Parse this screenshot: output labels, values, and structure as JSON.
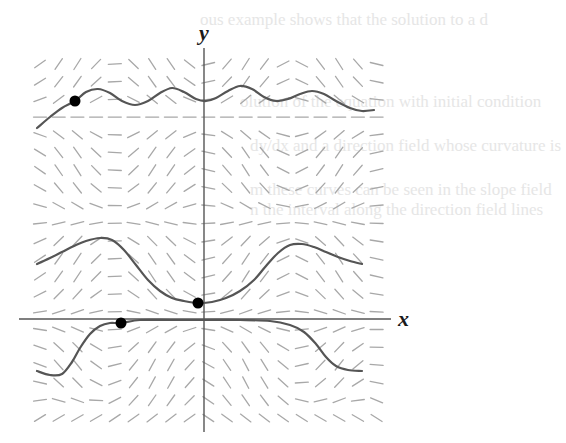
{
  "figure": {
    "type": "direction-field",
    "x_axis_label": "x",
    "y_axis_label": "y",
    "colors": {
      "background": "#ffffff",
      "axis": "#555555",
      "slope_segment": "#a8a8a8",
      "solution_curve": "#555555",
      "initial_point": "#000000",
      "bleed_text": "#e6e6e6"
    },
    "bleed_through_text": [
      {
        "text": "ous example shows that the solution to a d",
        "x": 200,
        "y": 10
      },
      {
        "text": "olution of the equation with initial condition",
        "x": 240,
        "y": 92
      },
      {
        "text": "dy/dx and a direction field whose curvature is",
        "x": 250,
        "y": 136
      },
      {
        "text": "m these curves can be seen in the slope field",
        "x": 250,
        "y": 180
      },
      {
        "text": "n the interval along the direction field lines",
        "x": 250,
        "y": 200
      }
    ],
    "axes": {
      "origin_px": [
        204,
        319
      ],
      "x_axis_px": {
        "x_start": 19,
        "x_end": 391,
        "y": 319
      },
      "y_axis_px": {
        "x": 204,
        "y_start": 48,
        "y_end": 432
      },
      "x_label_px": [
        398,
        306
      ],
      "y_label_px": [
        199,
        20
      ]
    },
    "slope_field": {
      "grid_x_start": 40,
      "grid_x_end": 378,
      "grid_x_step": 18.7,
      "grid_y_start": 64,
      "grid_y_end": 418,
      "grid_y_step": 17.7,
      "segment_length": 13
    },
    "solution_curves": [
      {
        "name": "upper-curve",
        "points": [
          [
            37,
            128
          ],
          [
            50,
            117
          ],
          [
            62,
            108
          ],
          [
            75,
            101
          ],
          [
            86,
            92
          ],
          [
            98,
            89
          ],
          [
            110,
            93
          ],
          [
            122,
            101
          ],
          [
            135,
            105
          ],
          [
            148,
            101
          ],
          [
            160,
            93
          ],
          [
            172,
            88
          ],
          [
            184,
            92
          ],
          [
            196,
            99
          ],
          [
            206,
            101
          ],
          [
            216,
            98
          ],
          [
            228,
            91
          ],
          [
            240,
            86
          ],
          [
            252,
            89
          ],
          [
            264,
            97
          ],
          [
            276,
            101
          ],
          [
            288,
            99
          ],
          [
            300,
            94
          ],
          [
            312,
            91
          ],
          [
            324,
            94
          ],
          [
            336,
            101
          ],
          [
            350,
            108
          ],
          [
            362,
            111
          ],
          [
            374,
            110
          ]
        ]
      },
      {
        "name": "middle-curve",
        "points": [
          [
            37,
            264
          ],
          [
            50,
            258
          ],
          [
            62,
            252
          ],
          [
            74,
            246
          ],
          [
            86,
            241
          ],
          [
            100,
            238
          ],
          [
            112,
            240
          ],
          [
            124,
            250
          ],
          [
            136,
            265
          ],
          [
            148,
            280
          ],
          [
            160,
            291
          ],
          [
            172,
            298
          ],
          [
            184,
            301
          ],
          [
            198,
            303
          ],
          [
            212,
            302
          ],
          [
            226,
            298
          ],
          [
            240,
            291
          ],
          [
            254,
            280
          ],
          [
            266,
            266
          ],
          [
            278,
            253
          ],
          [
            290,
            245
          ],
          [
            302,
            244
          ],
          [
            314,
            247
          ],
          [
            326,
            252
          ],
          [
            338,
            257
          ],
          [
            350,
            261
          ],
          [
            362,
            264
          ]
        ]
      },
      {
        "name": "lower-curve",
        "points": [
          [
            37,
            371
          ],
          [
            50,
            375
          ],
          [
            62,
            374
          ],
          [
            72,
            362
          ],
          [
            80,
            348
          ],
          [
            90,
            334
          ],
          [
            100,
            326
          ],
          [
            110,
            323
          ],
          [
            121,
            323
          ],
          [
            140,
            320
          ],
          [
            170,
            320
          ],
          [
            204,
            320
          ],
          [
            240,
            320
          ],
          [
            270,
            321
          ],
          [
            290,
            325
          ],
          [
            304,
            332
          ],
          [
            316,
            344
          ],
          [
            326,
            357
          ],
          [
            336,
            366
          ],
          [
            348,
            370
          ],
          [
            362,
            371
          ]
        ]
      }
    ],
    "initial_points": [
      {
        "name": "initial-point-upper",
        "px": [
          75,
          101
        ]
      },
      {
        "name": "initial-point-middle",
        "px": [
          198,
          303
        ]
      },
      {
        "name": "initial-point-lower",
        "px": [
          121,
          323
        ]
      }
    ]
  }
}
